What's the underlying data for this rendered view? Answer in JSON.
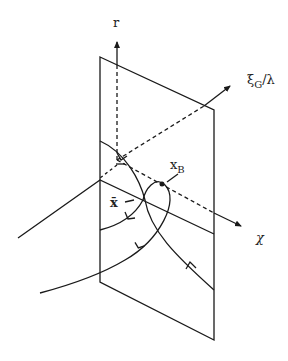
{
  "labels": {
    "r_axis": "r",
    "xi_axis_main": "ξ",
    "xi_axis_sub": "G",
    "xi_axis_tail": "/λ",
    "chi_axis": "χ",
    "xb_main": "x",
    "xb_sub": "B",
    "xbar": "x̄"
  },
  "colors": {
    "line": "#1a1a1a",
    "background": "#ffffff"
  }
}
